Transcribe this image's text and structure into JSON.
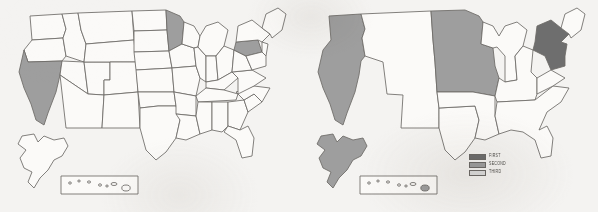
{
  "figure": {
    "type": "choropleth-map-pair",
    "background_color": "#f4f3f1",
    "outline_color": "#6d6a67"
  },
  "palette": {
    "first": "#6e6e6e",
    "second": "#9e9e9e",
    "third": "#dcdcdc",
    "unshaded": "#fbfaf8"
  },
  "maps": [
    {
      "id": "map-left",
      "position": "left",
      "has_legend": false,
      "has_alaska_inset": true,
      "has_hawaii_inset": true,
      "shaded_regions": [
        {
          "name": "California",
          "rank": "SECOND",
          "color": "#9e9e9e"
        },
        {
          "name": "Minnesota",
          "rank": "SECOND",
          "color": "#9e9e9e"
        },
        {
          "name": "Pennsylvania",
          "rank": "SECOND",
          "color": "#9e9e9e"
        }
      ],
      "alaska_shaded": false,
      "hawaii_shaded": false
    },
    {
      "id": "map-right",
      "position": "right",
      "has_legend": true,
      "has_alaska_inset": true,
      "has_hawaii_inset": true,
      "shaded_regions": [
        {
          "name": "Pacific West",
          "rank": "SECOND",
          "color": "#9e9e9e"
        },
        {
          "name": "Northern Plains and Midwest",
          "rank": "SECOND",
          "color": "#9e9e9e"
        },
        {
          "name": "Northeast",
          "rank": "FIRST",
          "color": "#6e6e6e"
        },
        {
          "name": "Alaska",
          "rank": "SECOND",
          "color": "#9e9e9e"
        },
        {
          "name": "Hawaii",
          "rank": "SECOND",
          "color": "#9e9e9e"
        }
      ],
      "alaska_shaded": true,
      "hawaii_shaded": true
    }
  ],
  "legend": {
    "items": [
      {
        "label": "FIRST",
        "color": "#6e6e6e"
      },
      {
        "label": "SECOND",
        "color": "#9e9e9e"
      },
      {
        "label": "THIRD",
        "color": "#dcdcdc"
      }
    ]
  }
}
